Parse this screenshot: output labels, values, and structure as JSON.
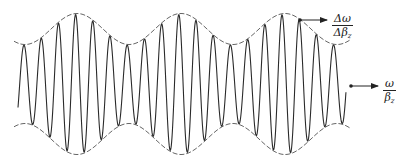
{
  "diagram": {
    "type": "amplitude-modulated wave packet (group vs phase velocity)",
    "colors": {
      "carrier": "#2a2a2a",
      "envelope": "#555555",
      "arrow": "#222222",
      "background": "#ffffff"
    },
    "envelope": {
      "style": "dashed",
      "center_y": 84,
      "mean_half_height": 55,
      "modulation_amplitude": 15.5,
      "period_px": 104,
      "peak_x": 77,
      "x_start": 14,
      "x_end": 350
    },
    "carrier": {
      "style": "solid",
      "period_px": 17.2,
      "x_start": 18,
      "x_end": 346,
      "first_peak_x": 24
    },
    "labels": {
      "group_velocity": {
        "numerator": "Δω",
        "denominator": "Δβ",
        "subscript": "z",
        "meaning": "group velocity"
      },
      "phase_velocity": {
        "numerator": "ω",
        "denominator": "β",
        "subscript": "z",
        "meaning": "phase velocity"
      }
    },
    "arrows": {
      "group_velocity": {
        "x1": 300,
        "y1": 20,
        "x2": 327,
        "y2": 20
      },
      "phase_velocity": {
        "x1": 351,
        "y1": 86,
        "x2": 378,
        "y2": 86
      }
    }
  }
}
